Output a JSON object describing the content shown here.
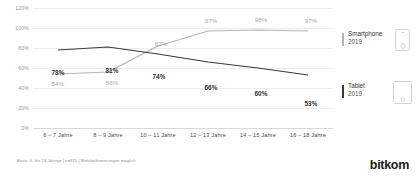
{
  "chart_data": {
    "type": "line",
    "title": "",
    "xlabel": "",
    "ylabel": "",
    "ylim": [
      0,
      120
    ],
    "grid": true,
    "legend_position": "right",
    "categories": [
      "6 – 7 Jahre",
      "8 – 9 Jahre",
      "10 – 11 Jahre",
      "12 – 13 Jahre",
      "14 – 15 Jahre",
      "16 – 18 Jahre"
    ],
    "ytick_labels": [
      "0%",
      "20%",
      "40%",
      "60%",
      "80%",
      "100%",
      "120%"
    ],
    "ytick_values": [
      0,
      20,
      40,
      60,
      80,
      100,
      120
    ],
    "series": [
      {
        "name": "Smartphone 2019",
        "color": "#b4b4b4",
        "values": [
          54,
          56,
          82,
          97,
          98,
          97
        ],
        "labels": [
          "54%",
          "56%",
          "82%",
          "97%",
          "98%",
          "97%"
        ]
      },
      {
        "name": "Tablet 2019",
        "color": "#3a3a3a",
        "values": [
          78,
          81,
          74,
          66,
          60,
          53
        ],
        "labels": [
          "78%",
          "81%",
          "74%",
          "66%",
          "60%",
          "53%"
        ]
      }
    ]
  },
  "legend": {
    "items": [
      {
        "name": "Smartphone",
        "year": "2019",
        "icon": "smartphone-icon",
        "color": "#b4b4b4"
      },
      {
        "name": "Tablet",
        "year": "2019",
        "icon": "tablet-icon",
        "color": "#3a3a3a"
      }
    ]
  },
  "footer": {
    "note": "Basis: 6- bis 18-Jährige | n=915 | Mehrfachnennungen möglich",
    "logo": "bitkom"
  }
}
